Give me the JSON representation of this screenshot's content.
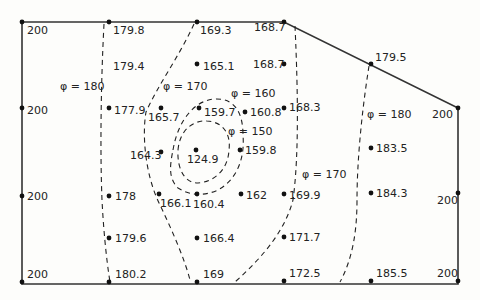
{
  "diagram": {
    "type": "potential-field grid with equipotential contours",
    "boundary_color": "#333333",
    "contour_color": "#222222",
    "boundary": [
      [
        22,
        22
      ],
      [
        284,
        22
      ],
      [
        458,
        108
      ],
      [
        458,
        284
      ],
      [
        22,
        284
      ]
    ],
    "nodes": [
      {
        "x": 22,
        "y": 22,
        "v": "200",
        "dot": true,
        "lx": 27,
        "ly": 34
      },
      {
        "x": 109,
        "y": 22,
        "v": "179.8",
        "dot": true,
        "lx": 113,
        "ly": 34
      },
      {
        "x": 197,
        "y": 22,
        "v": "169.3",
        "dot": true,
        "lx": 200,
        "ly": 34
      },
      {
        "x": 284,
        "y": 22,
        "v": "168.7",
        "dot": true,
        "lx": 254,
        "ly": 31
      },
      {
        "x": 371,
        "y": 64,
        "v": "179.5",
        "dot": true,
        "lx": 375,
        "ly": 61
      },
      {
        "x": 458,
        "y": 108,
        "v": "200",
        "dot": true,
        "lx": 432,
        "ly": 118
      },
      {
        "x": 109,
        "y": 64,
        "v": "179.4",
        "dot": false,
        "lx": 113,
        "ly": 70
      },
      {
        "x": 197,
        "y": 64,
        "v": "165.1",
        "dot": true,
        "lx": 203,
        "ly": 70
      },
      {
        "x": 284,
        "y": 64,
        "v": "168.7",
        "dot": true,
        "lx": 253,
        "ly": 68
      },
      {
        "x": 22,
        "y": 108,
        "v": "200",
        "dot": true,
        "lx": 27,
        "ly": 114
      },
      {
        "x": 109,
        "y": 108,
        "v": "177.9",
        "dot": true,
        "lx": 114,
        "ly": 114
      },
      {
        "x": 161,
        "y": 108,
        "v": "165.7",
        "dot": true,
        "lx": 148,
        "ly": 121
      },
      {
        "x": 199,
        "y": 108,
        "v": "159.7",
        "dot": true,
        "lx": 204,
        "ly": 116
      },
      {
        "x": 245,
        "y": 112,
        "v": "160.8",
        "dot": true,
        "lx": 250,
        "ly": 116
      },
      {
        "x": 284,
        "y": 108,
        "v": "168.3",
        "dot": true,
        "lx": 289,
        "ly": 111
      },
      {
        "x": 371,
        "y": 148,
        "v": "183.5",
        "dot": true,
        "lx": 376,
        "ly": 152
      },
      {
        "x": 161,
        "y": 152,
        "v": "164.3",
        "dot": true,
        "lx": 130,
        "ly": 159
      },
      {
        "x": 196,
        "y": 150,
        "v": "124.9",
        "dot": true,
        "lx": 187,
        "ly": 163
      },
      {
        "x": 240,
        "y": 150,
        "v": "159.8",
        "dot": true,
        "lx": 245,
        "ly": 154
      },
      {
        "x": 22,
        "y": 196,
        "v": "200",
        "dot": true,
        "lx": 27,
        "ly": 200
      },
      {
        "x": 109,
        "y": 196,
        "v": "178",
        "dot": true,
        "lx": 115,
        "ly": 200
      },
      {
        "x": 159,
        "y": 194,
        "v": "166.1",
        "dot": true,
        "lx": 160,
        "ly": 207
      },
      {
        "x": 197,
        "y": 194,
        "v": "160.4",
        "dot": true,
        "lx": 193,
        "ly": 208
      },
      {
        "x": 241,
        "y": 194,
        "v": "162",
        "dot": true,
        "lx": 246,
        "ly": 199
      },
      {
        "x": 284,
        "y": 194,
        "v": "169.9",
        "dot": true,
        "lx": 289,
        "ly": 199
      },
      {
        "x": 371,
        "y": 193,
        "v": "184.3",
        "dot": true,
        "lx": 376,
        "ly": 197
      },
      {
        "x": 458,
        "y": 193,
        "v": "200",
        "dot": true,
        "lx": 437,
        "ly": 204
      },
      {
        "x": 109,
        "y": 238,
        "v": "179.6",
        "dot": true,
        "lx": 115,
        "ly": 242
      },
      {
        "x": 197,
        "y": 238,
        "v": "166.4",
        "dot": true,
        "lx": 203,
        "ly": 242
      },
      {
        "x": 284,
        "y": 237,
        "v": "171.7",
        "dot": true,
        "lx": 289,
        "ly": 241
      },
      {
        "x": 22,
        "y": 282,
        "v": "200",
        "dot": true,
        "lx": 27,
        "ly": 278
      },
      {
        "x": 109,
        "y": 282,
        "v": "180.2",
        "dot": true,
        "lx": 115,
        "ly": 278
      },
      {
        "x": 197,
        "y": 282,
        "v": "169",
        "dot": true,
        "lx": 203,
        "ly": 278
      },
      {
        "x": 284,
        "y": 281,
        "v": "172.5",
        "dot": true,
        "lx": 289,
        "ly": 277
      },
      {
        "x": 371,
        "y": 281,
        "v": "185.5",
        "dot": true,
        "lx": 376,
        "ly": 277
      },
      {
        "x": 458,
        "y": 281,
        "v": "200",
        "dot": true,
        "lx": 437,
        "ly": 277
      }
    ],
    "contours": [
      {
        "label": "φ = 180",
        "lx": 60,
        "ly": 90,
        "path": "M104,24 C101,80 100,150 102,200 C104,240 108,270 110,282"
      },
      {
        "label": "φ = 170",
        "lx": 163,
        "ly": 90,
        "path": "M194,24 C180,55 158,85 146,112 C142,135 145,175 160,205 C172,230 185,260 190,280"
      },
      {
        "label": "φ = 160",
        "lx": 231,
        "ly": 97,
        "path": "M173,150 C178,120 195,100 215,99 C238,98 243,118 243,135 C245,160 236,180 218,190 C205,196 190,196 178,188 C168,178 170,165 173,150 Z"
      },
      {
        "label": "φ = 150",
        "lx": 228,
        "ly": 135,
        "path": "M178,150 C180,128 195,120 207,121 C224,122 231,135 229,150 C228,170 214,182 198,183 C184,183 177,168 178,150 Z"
      },
      {
        "label": "φ = 170",
        "lx": 302,
        "ly": 178,
        "path": "M295,26 C297,70 300,150 293,200 C285,230 265,255 235,282"
      },
      {
        "label": "φ = 180",
        "lx": 367,
        "ly": 118,
        "path": "M369,66 C362,110 357,160 357,200 C357,230 353,258 340,282"
      }
    ]
  }
}
